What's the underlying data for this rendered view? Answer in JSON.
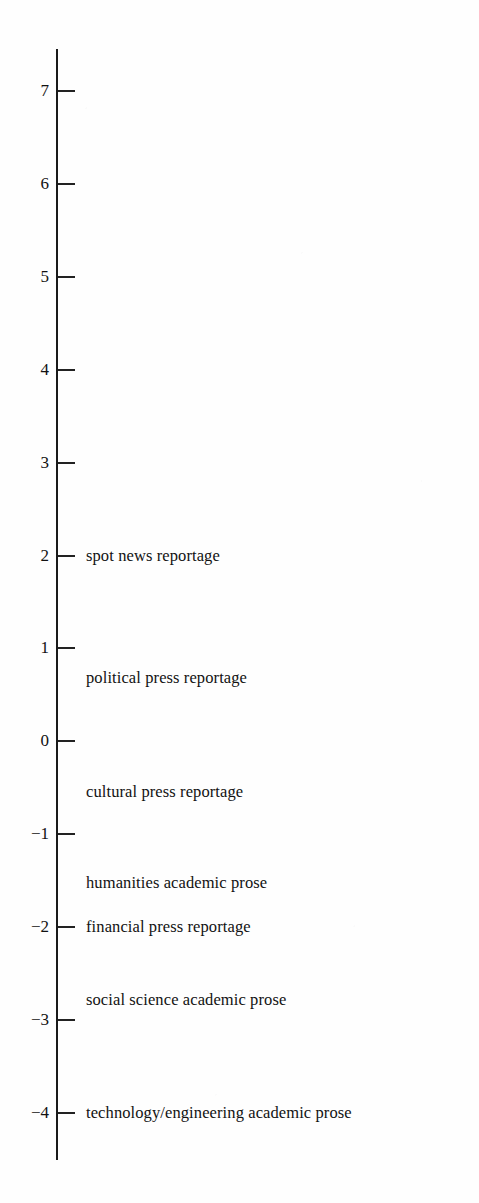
{
  "chart_data": {
    "type": "scatter",
    "title": "",
    "subtitle": "",
    "xlabel": "",
    "ylabel": "",
    "orientation": "vertical-scale",
    "grid": false,
    "legend": null,
    "axis": {
      "ticks": [
        7,
        6,
        5,
        4,
        3,
        2,
        1,
        0,
        -1,
        -2,
        -3,
        -4
      ],
      "tick_labels": [
        "7",
        "6",
        "5",
        "4",
        "3",
        "2",
        "1",
        "0",
        "−1",
        "−2",
        "−3",
        "−4"
      ],
      "ylim": [
        -4.6,
        7.6
      ],
      "tick_interval": 1
    },
    "categories": [
      "spot news reportage",
      "political press reportage",
      "cultural press reportage",
      "humanities academic prose",
      "financial press reportage",
      "social science academic prose",
      "technology/engineering academic prose"
    ],
    "values": [
      2.0,
      0.68,
      -0.55,
      -1.52,
      -2.0,
      -2.79,
      -4.0
    ],
    "points": [
      {
        "label": "spot news reportage",
        "value": 2.0
      },
      {
        "label": "political press reportage",
        "value": 0.68
      },
      {
        "label": "cultural press reportage",
        "value": -0.55
      },
      {
        "label": "humanities academic prose",
        "value": -1.52
      },
      {
        "label": "financial press reportage",
        "value": -2.0
      },
      {
        "label": "social science academic prose",
        "value": -2.79
      },
      {
        "label": "technology/engineering academic prose",
        "value": -4.0
      }
    ]
  },
  "colors": {
    "axis": "#1a1a1a",
    "tick": "#222222",
    "text": "#121212",
    "background": "#fefefe"
  },
  "geometry": {
    "axis_x": 56,
    "axis_top": 49,
    "axis_bottom": 1160,
    "pixels_per_unit": 92.9,
    "value_7_y": 91,
    "tick_length": 17,
    "label_x": 86,
    "tick_label_right": 49
  }
}
